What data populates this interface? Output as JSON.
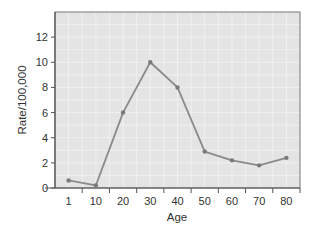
{
  "chart_data": {
    "type": "line",
    "title": "",
    "xlabel": "Age",
    "ylabel": "Rate/100,000",
    "categories": [
      "1",
      "10",
      "20",
      "30",
      "40",
      "50",
      "60",
      "70",
      "80"
    ],
    "series": [
      {
        "name": "Rate",
        "values": [
          0.6,
          0.2,
          6.0,
          10.0,
          8.0,
          2.9,
          2.2,
          1.8,
          2.4
        ]
      }
    ],
    "yticks": [
      0,
      2,
      4,
      6,
      8,
      10,
      12
    ],
    "ylim": [
      0,
      14
    ],
    "grid": true,
    "legend": null,
    "colors": {
      "plot_background": "#e4e4e4",
      "grid": "#f2f2f2",
      "line": "#8a8a8a",
      "marker": "#7a7a7a",
      "axis": "#555555",
      "frame": "#777777",
      "text": "#333333"
    }
  }
}
